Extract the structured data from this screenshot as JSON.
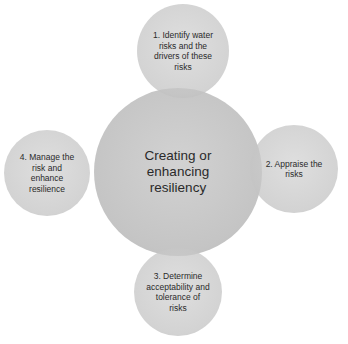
{
  "diagram": {
    "center": {
      "label": "Creating or enhancing resiliency"
    },
    "steps": [
      {
        "label": "1. Identify water risks and the drivers of these risks",
        "position": "top"
      },
      {
        "label": "2. Appraise the risks",
        "position": "right"
      },
      {
        "label": "3. Determine acceptability and tolerance of risks",
        "position": "bottom"
      },
      {
        "label": "4. Manage the risk and enhance resilience",
        "position": "left"
      }
    ],
    "colors": {
      "circle": "#c4c4c4",
      "overlap": "#a6a6a6",
      "text": "#2a2a2a",
      "background": "#ffffff"
    }
  }
}
